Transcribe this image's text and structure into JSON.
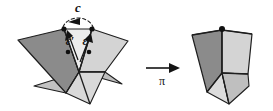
{
  "figure": {
    "background_color": "#ffffff",
    "labels": {
      "curve_c": "c",
      "epsilon_prime": "ε′",
      "epsilon": "ε",
      "map_pi": "π"
    },
    "colors": {
      "dark_face": "#8b8b8b",
      "mid_face": "#bdbdbd",
      "light_face": "#d4d4d4",
      "pale_face": "#e2e2e2",
      "outline": "#1a1a1a",
      "vertex_dot": "#101010",
      "label_text": "#141414"
    },
    "left_figure": {
      "name": "open-cone",
      "description": "Polyhedral cone cut open along a wedge, with gap at top",
      "faces": [
        {
          "name": "left-dark-face",
          "shade": "dark"
        },
        {
          "name": "left-inner-pale-face",
          "shade": "pale"
        },
        {
          "name": "right-light-face",
          "shade": "light"
        },
        {
          "name": "bottom-left-mid-face",
          "shade": "mid"
        },
        {
          "name": "bottom-right-mid-face",
          "shade": "mid"
        }
      ],
      "marked_vertices": 4,
      "arc_label": "c",
      "edge_labels": [
        "ε′",
        "ε"
      ]
    },
    "transform_arrow": {
      "name": "pi-arrow",
      "label": "π",
      "direction": "right"
    },
    "right_figure": {
      "name": "closed-cone",
      "description": "Cone after the gap is closed by the map pi",
      "faces": [
        {
          "name": "right-dark-face",
          "shade": "dark"
        },
        {
          "name": "right-light-face",
          "shade": "light"
        },
        {
          "name": "right-bottom-face",
          "shade": "mid"
        },
        {
          "name": "right-pale-face",
          "shade": "pale"
        }
      ],
      "marked_vertices": 1
    }
  }
}
